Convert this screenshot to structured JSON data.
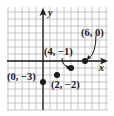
{
  "diagram": {
    "type": "coordinate-grid-plot",
    "axes": {
      "x_label": "x",
      "y_label": "y"
    },
    "grid": {
      "x_min": -5,
      "x_max": 9,
      "y_min": -7,
      "y_max": 7,
      "step": 1
    },
    "points": [
      {
        "x": 0,
        "y": -3,
        "label": "(0, −3)"
      },
      {
        "x": 2,
        "y": -2,
        "label": "(2, −2)"
      },
      {
        "x": 4,
        "y": -1,
        "label": "(4, −1)"
      },
      {
        "x": 6,
        "y": 0,
        "label": "(6, 0)"
      }
    ]
  },
  "colors": {
    "grid": "#b8b8b8",
    "axis": "#1a1a1a",
    "point": "#1a1a1a",
    "background": "#ffffff"
  }
}
